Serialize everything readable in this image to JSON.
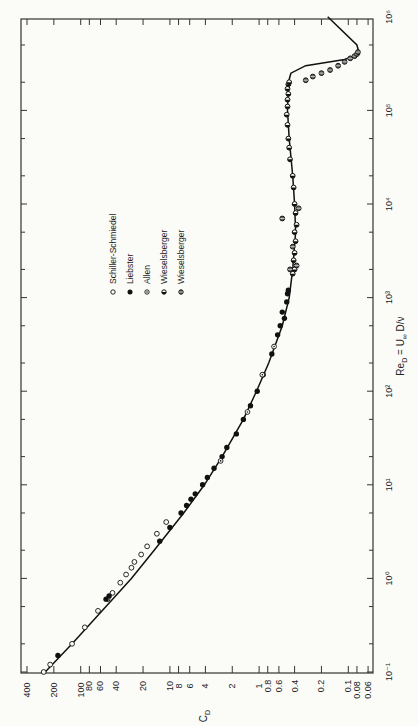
{
  "chart_data": {
    "type": "scatter",
    "title": "",
    "orientation": "rotated-90-ccw",
    "xlabel": "Re_D = U∞ D/ν",
    "ylabel": "C_D",
    "xscale": "log",
    "yscale": "log",
    "xlim": [
      0.1,
      1000000
    ],
    "ylim": [
      0.06,
      400
    ],
    "grid": false,
    "legend_position": "upper-left (rotated)",
    "x_ticks": [
      {
        "value": 0.1,
        "label": "10⁻¹"
      },
      {
        "value": 1,
        "label": "10⁰"
      },
      {
        "value": 10,
        "label": "10¹"
      },
      {
        "value": 100,
        "label": "10²"
      },
      {
        "value": 1000,
        "label": "10³"
      },
      {
        "value": 10000,
        "label": "10⁴"
      },
      {
        "value": 100000,
        "label": "10⁵"
      },
      {
        "value": 1000000,
        "label": "10⁶"
      }
    ],
    "y_ticks": [
      {
        "value": 400,
        "label": "400"
      },
      {
        "value": 200,
        "label": "200"
      },
      {
        "value": 100,
        "label": "100"
      },
      {
        "value": 80,
        "label": "80"
      },
      {
        "value": 60,
        "label": "60"
      },
      {
        "value": 40,
        "label": "40"
      },
      {
        "value": 20,
        "label": "20"
      },
      {
        "value": 10,
        "label": "10"
      },
      {
        "value": 8,
        "label": "8"
      },
      {
        "value": 6,
        "label": "6"
      },
      {
        "value": 4,
        "label": "4"
      },
      {
        "value": 2,
        "label": "2"
      },
      {
        "value": 1,
        "label": "1"
      },
      {
        "value": 0.8,
        "label": "0.8"
      },
      {
        "value": 0.6,
        "label": "0.6"
      },
      {
        "value": 0.4,
        "label": "0.4"
      },
      {
        "value": 0.2,
        "label": "0.2"
      },
      {
        "value": 0.1,
        "label": "0.1"
      },
      {
        "value": 0.08,
        "label": "0.08"
      },
      {
        "value": 0.06,
        "label": "0.06"
      }
    ],
    "curve": {
      "name": "theory / fit",
      "x": [
        0.1,
        0.2,
        0.5,
        1,
        2,
        5,
        10,
        20,
        50,
        100,
        200,
        500,
        1000,
        2000,
        5000,
        10000,
        20000,
        50000,
        100000,
        200000,
        250000,
        300000,
        350000,
        400000,
        500000,
        1000000
      ],
      "y": [
        250,
        125,
        52,
        27,
        15,
        7.0,
        4.1,
        2.6,
        1.5,
        1.07,
        0.78,
        0.55,
        0.46,
        0.42,
        0.39,
        0.4,
        0.42,
        0.46,
        0.48,
        0.47,
        0.44,
        0.3,
        0.11,
        0.075,
        0.08,
        0.17
      ]
    },
    "series": [
      {
        "name": "Schiller-Schmiedel",
        "marker": "open-circle",
        "x": [
          0.1,
          0.12,
          0.2,
          0.3,
          0.45,
          0.6,
          0.7,
          0.9,
          1.1,
          1.3,
          1.5,
          1.8,
          2.2,
          3,
          4
        ],
        "y": [
          260,
          220,
          125,
          90,
          64,
          50,
          44,
          36,
          31,
          27,
          25,
          21,
          18,
          14,
          11
        ]
      },
      {
        "name": "Liebster",
        "marker": "filled-circle",
        "x": [
          0.15,
          0.6,
          0.65,
          2.5,
          3.5,
          5,
          6,
          7,
          8,
          10,
          12,
          15,
          20,
          25,
          35,
          50,
          70,
          100,
          150,
          250,
          400,
          500,
          600,
          700,
          900,
          1100,
          1200
        ],
        "y": [
          180,
          52,
          48,
          13,
          10,
          7.5,
          6.5,
          5.8,
          5.2,
          4.3,
          3.8,
          3.2,
          2.6,
          2.3,
          1.8,
          1.5,
          1.25,
          1.05,
          0.9,
          0.72,
          0.62,
          0.58,
          0.52,
          0.55,
          0.49,
          0.48,
          0.47
        ]
      },
      {
        "name": "Allen",
        "marker": "dotted-circle",
        "x": [
          18,
          60,
          150,
          300
        ],
        "y": [
          2.7,
          1.35,
          0.92,
          0.68
        ]
      },
      {
        "name": "Wieselsberger",
        "marker": "half-circle",
        "x": [
          1800,
          2000,
          2500,
          3000,
          4000,
          5000,
          6000,
          8000,
          10000,
          15000,
          20000,
          30000,
          40000,
          50000,
          70000,
          90000,
          110000,
          130000,
          150000,
          170000,
          190000,
          200000
        ],
        "y": [
          0.42,
          0.4,
          0.41,
          0.4,
          0.39,
          0.4,
          0.38,
          0.39,
          0.4,
          0.41,
          0.42,
          0.45,
          0.46,
          0.47,
          0.48,
          0.49,
          0.48,
          0.48,
          0.47,
          0.48,
          0.47,
          0.46
        ]
      },
      {
        "name": "Wieselsberger",
        "marker": "crossed-circle",
        "x": [
          2000,
          2200,
          3500,
          7000,
          9000,
          210000,
          230000,
          250000,
          270000,
          300000,
          330000,
          360000,
          380000,
          400000,
          420000
        ],
        "y": [
          0.45,
          0.38,
          0.42,
          0.55,
          0.36,
          0.3,
          0.25,
          0.2,
          0.16,
          0.13,
          0.11,
          0.095,
          0.085,
          0.08,
          0.078
        ]
      }
    ]
  },
  "legend": {
    "items": [
      {
        "label": "Schiller-Schmiedel",
        "marker": "open-circle"
      },
      {
        "label": "Liebster",
        "marker": "filled-circle"
      },
      {
        "label": "Allen",
        "marker": "dotted-circle"
      },
      {
        "label": "Wieselsberger",
        "marker": "half-circle"
      },
      {
        "label": "Wieselsberger",
        "marker": "crossed-circle"
      }
    ]
  },
  "axes": {
    "re_title_main": "Re",
    "re_title_sub": "D",
    "re_title_rest": " = U",
    "re_title_sub2": "∞",
    "re_title_end": " D/ν",
    "cd_title_main": "C",
    "cd_title_sub": "D"
  }
}
